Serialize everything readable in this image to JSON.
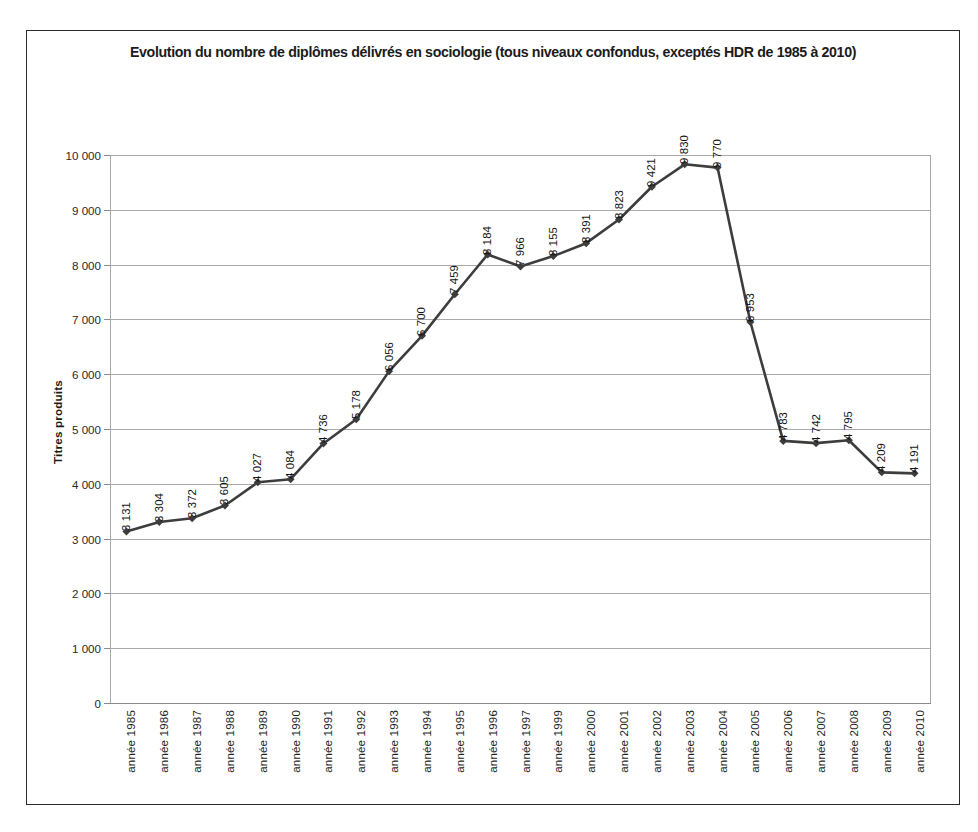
{
  "chart_data": {
    "type": "line",
    "title": "Evolution du nombre de diplômes délivrés en sociologie (tous niveaux confondus, exceptés HDR de 1985 à 2010)",
    "xlabel": "",
    "ylabel": "Titres produits",
    "ylim": [
      0,
      10000
    ],
    "ytick_labels": [
      "10 000",
      "9 000",
      "8 000",
      "7 000",
      "6 000",
      "5 000",
      "4 000",
      "3 000",
      "2 000",
      "1 000",
      "0"
    ],
    "ytick_values": [
      10000,
      9000,
      8000,
      7000,
      6000,
      5000,
      4000,
      3000,
      2000,
      1000,
      0
    ],
    "grid": true,
    "legend": "none",
    "categories": [
      "année 1985",
      "année 1986",
      "année 1987",
      "année 1988",
      "année 1989",
      "année 1990",
      "année 1991",
      "année 1992",
      "année 1993",
      "année 1994",
      "année 1995",
      "année 1996",
      "année 1997",
      "année 1999",
      "année 2000",
      "année 2001",
      "année 2002",
      "année 2003",
      "année 2004",
      "année 2005",
      "année 2006",
      "année 2007",
      "année 2008",
      "année 2009",
      "année 2010"
    ],
    "values": [
      3131,
      3304,
      3372,
      3605,
      4027,
      4084,
      4736,
      5178,
      6056,
      6700,
      7459,
      8184,
      7966,
      8155,
      8391,
      8823,
      9421,
      9830,
      9770,
      6953,
      4783,
      4742,
      4795,
      4209,
      4191
    ],
    "point_labels": [
      "3 131",
      "3 304",
      "3 372",
      "3 605",
      "4 027",
      "4 084",
      "4 736",
      "5 178",
      "6 056",
      "6 700",
      "7 459",
      "8 184",
      "7 966",
      "8 155",
      "8 391",
      "8 823",
      "9 421",
      "9 830",
      "9 770",
      "6 953",
      "4 783",
      "4 742",
      "4 795",
      "4 209",
      "4 191"
    ],
    "series_color": "#3d3d3d",
    "grid_color": "#a9a9a9",
    "marker": "diamond"
  }
}
